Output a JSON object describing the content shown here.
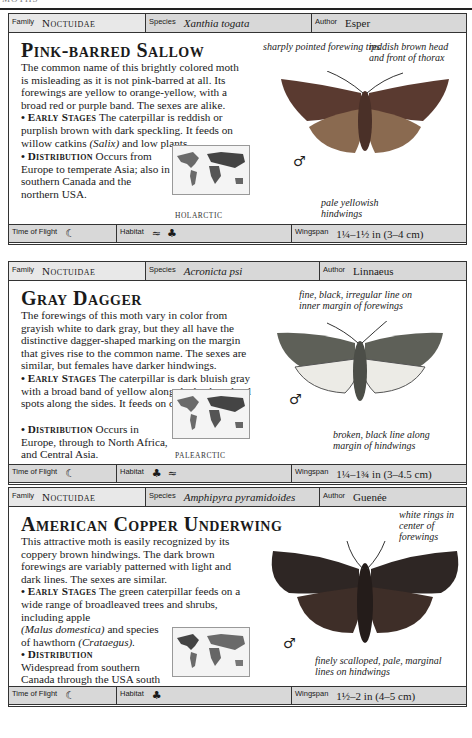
{
  "page": {
    "running_head": "MOTHS"
  },
  "entries": [
    {
      "family_label": "Family",
      "family": "Noctuidae",
      "species_label": "Species",
      "species": "Xanthia togata",
      "author_label": "Author",
      "author": "Esper",
      "title": "Pink-barred Sallow",
      "description": "The common name of this brightly colored moth is misleading as it is not pink-barred at all. Its forewings are yellow to orange-yellow, with a broad red or purple band. The sexes are alike.",
      "early_stages_label": "Early Stages",
      "early_stages_1": "The caterpillar is reddish or purplish brown with dark speckling. It feeds on willow catkins ",
      "early_stages_italic": "(Salix)",
      "early_stages_2": " and low plants.",
      "distribution_label": "Distribution",
      "distribution": "Occurs from Europe to temperate Asia; also in southern Canada and the northern USA.",
      "region": "HOLARCTIC",
      "sex_symbol": "♂",
      "annotations": [
        "sharply pointed forewing tips",
        "reddish brown head and front of thorax",
        "pale yellowish hindwings"
      ],
      "time_of_flight_label": "Time of Flight",
      "time_of_flight_icon": "moon-icon",
      "habitat_label": "Habitat",
      "habitat_icons": [
        "wetland-icon",
        "tree-icon"
      ],
      "wingspan_label": "Wingspan",
      "wingspan": "1¼–1½ in (3–4 cm)",
      "colors": {
        "forewing": "#5a3a30",
        "hindwing": "#8a6a50"
      }
    },
    {
      "family_label": "Family",
      "family": "Noctuidae",
      "species_label": "Species",
      "species": "Acronicta psi",
      "author_label": "Author",
      "author": "Linnaeus",
      "title": "Gray Dagger",
      "description": "The forewings of this moth vary in color from grayish white to dark gray, but they all have the distinctive dagger-shaped marking on the margin that gives rise to the common name. The sexes are similar, but females have darker hindwings.",
      "early_stages_label": "Early Stages",
      "early_stages_1": "The caterpillar is dark bluish gray with a broad band of yellow along the back and red spots along the sides. It feeds on deciduous trees.",
      "distribution_label": "Distribution",
      "distribution": "Occurs in Europe, through to North Africa, and Central Asia.",
      "region": "PALEARCTIC",
      "sex_symbol": "♂",
      "annotations": [
        "fine, black, irregular line on inner margin of forewings",
        "broken, black line along margin of hindwings"
      ],
      "time_of_flight_label": "Time of Flight",
      "time_of_flight_icon": "moon-icon",
      "habitat_label": "Habitat",
      "habitat_icons": [
        "tree-icon",
        "grassland-icon"
      ],
      "wingspan_label": "Wingspan",
      "wingspan": "1¼–1¾ in (3–4.5 cm)",
      "colors": {
        "forewing": "#5e6058",
        "hindwing": "#e8e6e0"
      }
    },
    {
      "family_label": "Family",
      "family": "Noctuidae",
      "species_label": "Species",
      "species": "Amphipyra pyramidoides",
      "author_label": "Author",
      "author": "Guenée",
      "title": "American Copper Underwing",
      "description": "This attractive moth is easily recognized by its coppery brown hindwings. The dark brown forewings are variably patterned with light and dark lines. The sexes are similar.",
      "early_stages_label": "Early Stages",
      "early_stages_1": "The green caterpillar feeds on a wide range of broadleaved trees and shrubs, including apple ",
      "early_stages_italic": "(Malus domestica)",
      "early_stages_2": " and species of hawthorn ",
      "early_stages_italic_2": "(Crataegus).",
      "distribution_label": "Distribution",
      "distribution": "Widespread from southern Canada through the USA south to Mexico.",
      "region": "NEARCTIC",
      "sex_symbol": "♂",
      "annotations": [
        "white rings in center of forewings",
        "finely scalloped, pale, marginal lines on hindwings"
      ],
      "time_of_flight_label": "Time of Flight",
      "time_of_flight_icon": "moon-icon",
      "habitat_label": "Habitat",
      "habitat_icons": [
        "tree-icon"
      ],
      "wingspan_label": "Wingspan",
      "wingspan": "1½–2 in (4–5 cm)",
      "colors": {
        "forewing": "#2e2624",
        "hindwing": "#3e2e28"
      }
    }
  ],
  "glyphs": {
    "moon": "☾",
    "tree": "♣",
    "wetland": "≈",
    "grass": "ᨀ"
  }
}
